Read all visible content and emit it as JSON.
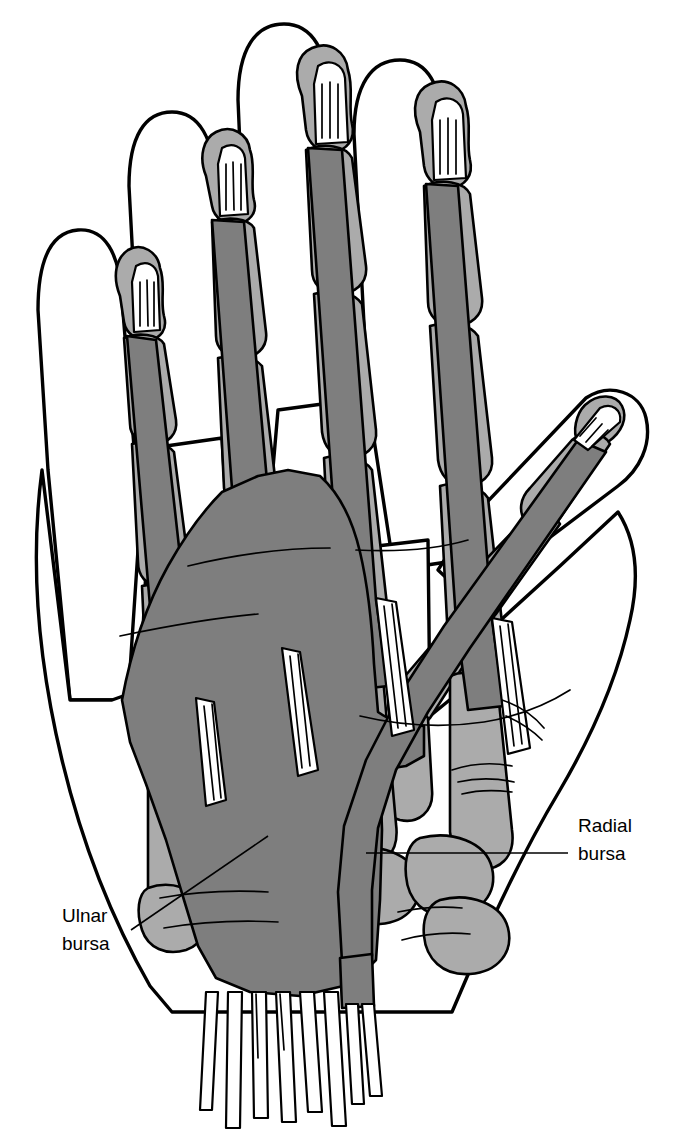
{
  "figure": {
    "kind": "anatomical-illustration",
    "background_color": "#ffffff",
    "line_color": "#000000"
  },
  "palette": {
    "skin_fill": "#ffffff",
    "bone_fill": "#ababab",
    "sheath_fill": "#7e7e7e",
    "tendon_fill": "#ffffff",
    "outline": "#000000"
  },
  "labels": [
    {
      "id": "radial-bursa",
      "line1": "Radial",
      "line2": "bursa",
      "text_x": 578,
      "line1_y": 832,
      "line2_y": 860,
      "leader": {
        "x1": 366,
        "y1": 853,
        "x2": 568,
        "y2": 853
      }
    },
    {
      "id": "ulnar-bursa",
      "line1": "Ulnar",
      "line2": "bursa",
      "text_x": 62,
      "line1_y": 922,
      "line2_y": 950,
      "leader": {
        "x1": 131,
        "y1": 930,
        "x2": 268,
        "y2": 836
      }
    }
  ],
  "structures": {
    "digits": [
      {
        "name": "little-finger",
        "index": 1
      },
      {
        "name": "ring-finger",
        "index": 2
      },
      {
        "name": "middle-finger",
        "index": 3
      },
      {
        "name": "index-finger",
        "index": 4
      },
      {
        "name": "thumb",
        "index": 5
      }
    ],
    "regions": [
      "digital-synovial-sheaths",
      "ulnar-bursa",
      "radial-bursa",
      "flexor-tendons",
      "lumbrical-muscles",
      "metacarpals",
      "phalanges",
      "carpal-bones"
    ]
  }
}
